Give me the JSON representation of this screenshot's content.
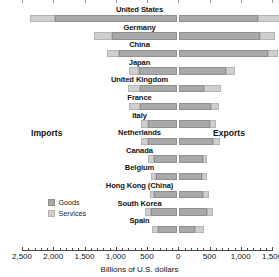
{
  "chart_data": {
    "type": "bar",
    "subtype": "diverging-stacked-horizontal",
    "title": "",
    "xlabel": "Billions of U.S. dollars",
    "ylabel": "",
    "left_axis_label": "Imports",
    "right_axis_label": "Exports",
    "grid": false,
    "legend_position": "inside-left",
    "legend": [
      "Goods",
      "Services"
    ],
    "colors": {
      "goods": "#a9a9a9",
      "services": "#cfcfcf"
    },
    "axis": {
      "unit": "Billions of U.S. dollars",
      "left_max": 2500,
      "right_max": 1500,
      "tick_step": 500,
      "minor_tick_step": 100,
      "tick_labels": [
        "2,500",
        "2,000",
        "1,500",
        "1,000",
        "500",
        "0",
        "500",
        "1,000",
        "1,500"
      ],
      "tick_values": [
        -2500,
        -2000,
        -1500,
        -1000,
        -500,
        0,
        500,
        1000,
        1500
      ]
    },
    "categories": [
      "United States",
      "Germany",
      "China",
      "Japan",
      "United Kingdom",
      "France",
      "Italy",
      "Netherlands",
      "Canada",
      "Belgium",
      "Hong Kong (China)",
      "South Korea",
      "Spain"
    ],
    "series": [
      {
        "name": "Imports - Goods",
        "side": "left",
        "component": "Goods",
        "values": [
          1970,
          1060,
          956,
          621,
          620,
          615,
          485,
          478,
          390,
          353,
          393,
          435,
          332
        ]
      },
      {
        "name": "Imports - Services",
        "side": "left",
        "component": "Services",
        "values": [
          404,
          289,
          192,
          167,
          182,
          173,
          117,
          114,
          101,
          89,
          56,
          98,
          94
        ]
      },
      {
        "name": "Exports - Goods",
        "side": "right",
        "component": "Goods",
        "values": [
          1278,
          1303,
          1428,
          770,
          405,
          517,
          500,
          551,
          393,
          372,
          390,
          466,
          268
        ]
      },
      {
        "name": "Exports - Services",
        "side": "right",
        "component": "Services",
        "values": [
          563,
          245,
          170,
          139,
          273,
          142,
          102,
          110,
          68,
          89,
          107,
          95,
          141
        ]
      }
    ]
  }
}
